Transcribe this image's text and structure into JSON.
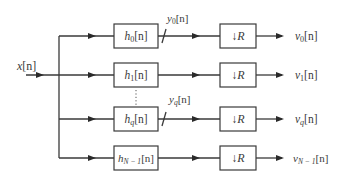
{
  "diagram": {
    "input": {
      "label": "x[n]",
      "base": "x",
      "arg": "[n]"
    },
    "branches": [
      {
        "filter_base": "h",
        "filter_sub": "0",
        "filter_arg": "[n]",
        "intermediate_base": "y",
        "intermediate_sub": "0",
        "intermediate_arg": "[n]",
        "downsampler": "↓R",
        "output_base": "v",
        "output_sub": "0",
        "output_arg": "[n]"
      },
      {
        "filter_base": "h",
        "filter_sub": "1",
        "filter_arg": "[n]",
        "intermediate_base": "",
        "intermediate_sub": "",
        "intermediate_arg": "",
        "downsampler": "↓R",
        "output_base": "v",
        "output_sub": "1",
        "output_arg": "[n]"
      },
      {
        "filter_base": "h",
        "filter_sub": "q",
        "filter_arg": "[n]",
        "intermediate_base": "y",
        "intermediate_sub": "q",
        "intermediate_arg": "[n]",
        "downsampler": "↓R",
        "output_base": "v",
        "output_sub": "q",
        "output_arg": "[n]"
      },
      {
        "filter_base": "h",
        "filter_sub": "N − 1",
        "filter_arg": "[n]",
        "intermediate_base": "",
        "intermediate_sub": "",
        "intermediate_arg": "",
        "downsampler": "↓R",
        "output_base": "v",
        "output_sub": "N − 1",
        "output_arg": "[n]"
      }
    ],
    "ellipsis": "⋮",
    "colors": {
      "line": "#3a3a3a",
      "text": "#3a3a3a",
      "background": "#ffffff"
    }
  }
}
